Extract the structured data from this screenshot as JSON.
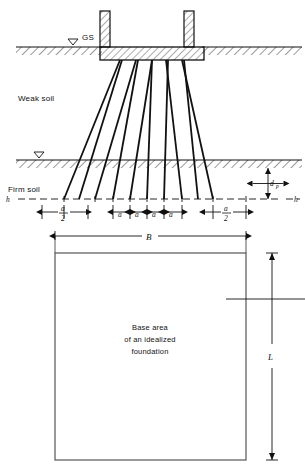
{
  "figure": {
    "type": "engineering-section-and-plan-diagram",
    "colors": {
      "line": "#111111",
      "hatch": "#333333",
      "background": "#ffffff",
      "rect_border": "#555555"
    }
  },
  "section": {
    "labels": {
      "ground_surface": "GS",
      "weak_soil": "Weak soil",
      "firm_soil": "Firm soil",
      "h_left": "h",
      "h_right": "h",
      "embedment_depth": "d",
      "embedment_depth_sub": "p"
    },
    "piles": {
      "count": 10,
      "groups": 5,
      "description": "battered and vertical piles fanning out from footing to firm soil",
      "head_x": [
        120,
        136,
        152,
        168,
        184
      ],
      "tip_x": [
        64,
        79,
        95,
        113,
        130,
        147,
        164,
        182,
        198,
        213
      ]
    },
    "strata": [
      {
        "name": "Ground surface hatch band",
        "top": 47,
        "height": 8
      },
      {
        "name": "Firm soil hatch band",
        "top": 160,
        "height": 8
      }
    ]
  },
  "dimensions": {
    "spacings": [
      {
        "label": "a/2",
        "numerator": "a",
        "denominator": "2"
      },
      {
        "label": "a",
        "numerator": "a",
        "denominator": ""
      },
      {
        "label": "a",
        "numerator": "a",
        "denominator": ""
      },
      {
        "label": "a",
        "numerator": "a",
        "denominator": ""
      },
      {
        "label": "a",
        "numerator": "a",
        "denominator": ""
      },
      {
        "label": "a/2",
        "numerator": "a",
        "denominator": "2"
      }
    ],
    "width": "B",
    "length": "L"
  },
  "plan": {
    "caption_line1": "Base area",
    "caption_line2": "of an idealized",
    "caption_line3": "foundation",
    "width_label": "B",
    "length_label": "L"
  }
}
